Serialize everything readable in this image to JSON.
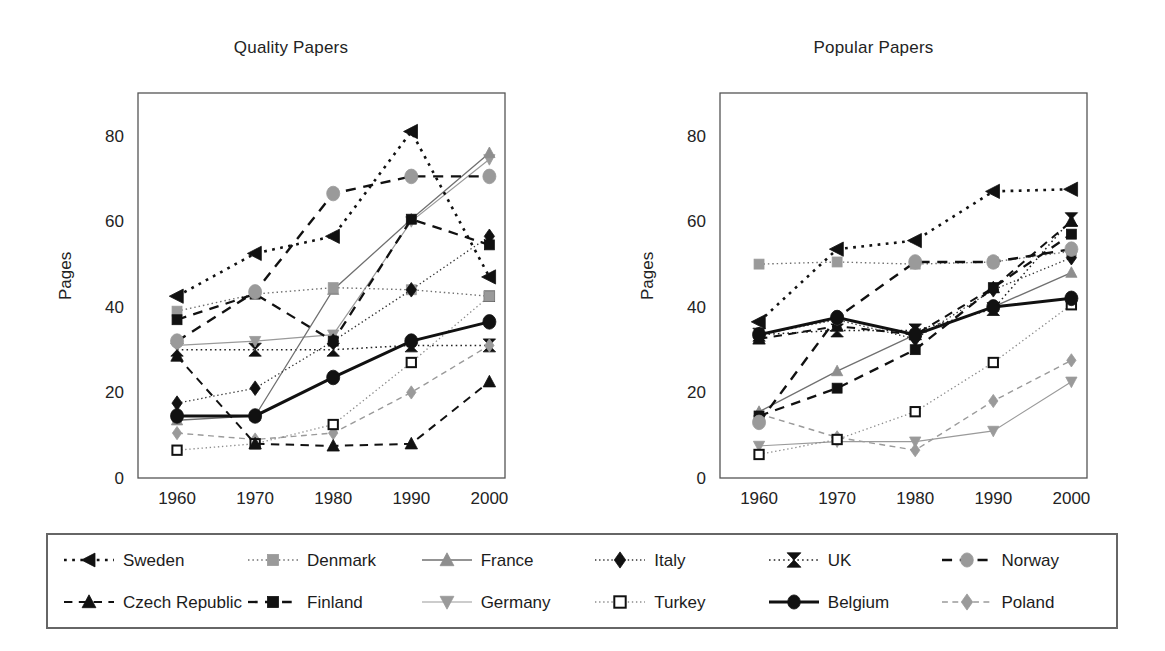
{
  "figure": {
    "y_axis_label": "Pages",
    "x_tick_labels": [
      "1960",
      "1970",
      "1980",
      "1990",
      "2000"
    ],
    "y_tick_labels": [
      "0",
      "20",
      "40",
      "60",
      "80"
    ]
  },
  "panels": [
    {
      "id": "quality",
      "title": "Quality Papers"
    },
    {
      "id": "popular",
      "title": "Popular Papers"
    }
  ],
  "legend": {
    "items": [
      {
        "name": "Sweden",
        "marker": "left-triangle-marker",
        "color": "#111111",
        "dash": "dotted",
        "linecolor": "#111111"
      },
      {
        "name": "Denmark",
        "marker": "square-marker",
        "color": "#9a9a9a",
        "dash": "dotted",
        "linecolor": "#7d7d7d"
      },
      {
        "name": "France",
        "marker": "up-triangle-marker",
        "color": "#8e8e8e",
        "dash": "solid",
        "linecolor": "#7d7d7d"
      },
      {
        "name": "Italy",
        "marker": "diamond-marker",
        "color": "#111111",
        "dash": "dotted",
        "linecolor": "#111111"
      },
      {
        "name": "UK",
        "marker": "bowtie-marker",
        "color": "#111111",
        "dash": "dotted",
        "linecolor": "#111111"
      },
      {
        "name": "Norway",
        "marker": "circle-marker",
        "color": "#9a9a9a",
        "dash": "dashed",
        "linecolor": "#111111"
      },
      {
        "name": "Czech Republic",
        "marker": "up-triangle-marker",
        "color": "#111111",
        "dash": "dashed",
        "linecolor": "#111111"
      },
      {
        "name": "Finland",
        "marker": "square-marker",
        "color": "#111111",
        "dash": "dashed",
        "linecolor": "#111111"
      },
      {
        "name": "Germany",
        "marker": "down-triangle-marker",
        "color": "#9a9a9a",
        "dash": "solid",
        "linecolor": "#9a9a9a"
      },
      {
        "name": "Turkey",
        "marker": "open-square-marker",
        "color": "#ffffff",
        "dash": "dotted",
        "linecolor": "#8a8a8a"
      },
      {
        "name": "Belgium",
        "marker": "circle-marker",
        "color": "#111111",
        "dash": "solid",
        "linecolor": "#111111"
      },
      {
        "name": "Poland",
        "marker": "diamond-marker",
        "color": "#9a9a9a",
        "dash": "dashed",
        "linecolor": "#9a9a9a"
      }
    ]
  },
  "chart_data": [
    {
      "type": "line",
      "title": "Quality Papers",
      "xlabel": "",
      "ylabel": "Pages",
      "x": [
        1960,
        1970,
        1980,
        1990,
        2000
      ],
      "xlim": [
        1955,
        2002
      ],
      "ylim": [
        0,
        90
      ],
      "yticks": [
        0,
        20,
        40,
        60,
        80
      ],
      "grid": false,
      "legend_position": "below-figure",
      "series": [
        {
          "name": "Sweden",
          "values": [
            42.5,
            52.5,
            56.5,
            81,
            47
          ]
        },
        {
          "name": "Denmark",
          "values": [
            39,
            43,
            44.5,
            44,
            42.5
          ]
        },
        {
          "name": "France",
          "values": [
            13.5,
            14.5,
            44,
            60.5,
            76
          ]
        },
        {
          "name": "Italy",
          "values": [
            17.5,
            21,
            32,
            44,
            56.5
          ]
        },
        {
          "name": "UK",
          "values": [
            30,
            30,
            30,
            31,
            31
          ]
        },
        {
          "name": "Norway",
          "values": [
            32,
            43.5,
            66.5,
            70.5,
            70.5
          ]
        },
        {
          "name": "Czech Republic",
          "values": [
            28.5,
            8,
            7.5,
            8,
            22.5
          ]
        },
        {
          "name": "Finland",
          "values": [
            37,
            43,
            32,
            60.5,
            54.5
          ]
        },
        {
          "name": "Germany",
          "values": [
            31,
            32,
            33.5,
            60,
            74.5
          ]
        },
        {
          "name": "Turkey",
          "values": [
            6.5,
            8,
            12.5,
            27,
            42.5
          ]
        },
        {
          "name": "Belgium",
          "values": [
            14.5,
            14.5,
            23.5,
            32,
            36.5
          ]
        },
        {
          "name": "Poland",
          "values": [
            10.5,
            9,
            10.5,
            20,
            31
          ]
        }
      ]
    },
    {
      "type": "line",
      "title": "Popular Papers",
      "xlabel": "",
      "ylabel": "Pages",
      "x": [
        1960,
        1970,
        1980,
        1990,
        2000
      ],
      "xlim": [
        1955,
        2002
      ],
      "ylim": [
        0,
        90
      ],
      "yticks": [
        0,
        20,
        40,
        60,
        80
      ],
      "grid": false,
      "legend_position": "below-figure",
      "series": [
        {
          "name": "Sweden",
          "values": [
            36.5,
            53.5,
            55.5,
            67,
            67.5
          ]
        },
        {
          "name": "Denmark",
          "values": [
            50,
            50.5,
            50,
            50.5,
            53
          ]
        },
        {
          "name": "France",
          "values": [
            15.5,
            25,
            33.5,
            40,
            48
          ]
        },
        {
          "name": "Italy",
          "values": [
            33.5,
            37,
            32.5,
            44,
            51.5
          ]
        },
        {
          "name": "UK",
          "values": [
            33.5,
            34.5,
            34.5,
            39.5,
            60.5
          ]
        },
        {
          "name": "Norway",
          "values": [
            13,
            37.5,
            50.5,
            50.5,
            53.5
          ]
        },
        {
          "name": "Czech Republic",
          "values": [
            32.5,
            35.5,
            33.5,
            44.5,
            60
          ]
        },
        {
          "name": "Finland",
          "values": [
            14.5,
            21,
            30,
            44.5,
            57
          ]
        },
        {
          "name": "Germany",
          "values": [
            7.5,
            8.5,
            8.5,
            11,
            22.5
          ]
        },
        {
          "name": "Turkey",
          "values": [
            5.5,
            9,
            15.5,
            27,
            40.5
          ]
        },
        {
          "name": "Belgium",
          "values": [
            33.5,
            37.5,
            33.5,
            40,
            42
          ]
        },
        {
          "name": "Poland",
          "values": [
            15,
            9.5,
            6.5,
            18,
            27.5
          ]
        }
      ]
    }
  ]
}
